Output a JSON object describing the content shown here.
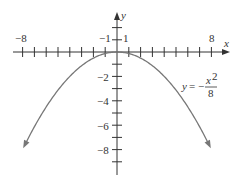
{
  "chart_data": {
    "type": "line",
    "title": "",
    "function": "y = -x^2/8",
    "equation_label": {
      "lhs": "y =",
      "sign": "−",
      "numerator": "x²",
      "denominator": "8"
    },
    "xlabel": "x",
    "ylabel": "y",
    "xlim": [
      -8,
      8
    ],
    "ylim": [
      -9,
      2
    ],
    "x_tick_labels": [
      {
        "value": -8,
        "label": "−8"
      },
      {
        "value": -1,
        "label": "−1"
      },
      {
        "value": 1,
        "label": "1"
      },
      {
        "value": 8,
        "label": "8"
      }
    ],
    "y_tick_labels": [
      {
        "value": -2,
        "label": "−2"
      },
      {
        "value": -4,
        "label": "−4"
      },
      {
        "value": -6,
        "label": "−6"
      },
      {
        "value": -8,
        "label": "−8"
      }
    ],
    "x_ticks": [
      -8,
      -7,
      -6,
      -5,
      -4,
      -3,
      -2,
      -1,
      1,
      2,
      3,
      4,
      5,
      6,
      7,
      8
    ],
    "y_ticks": [
      2,
      1,
      -1,
      -2,
      -3,
      -4,
      -5,
      -6,
      -7,
      -8,
      -9
    ],
    "series": [
      {
        "name": "y = -x^2/8",
        "x": [
          -8,
          -6,
          -4,
          -2,
          0,
          2,
          4,
          6,
          8
        ],
        "y": [
          -8,
          -4.5,
          -2,
          -0.5,
          0,
          -0.5,
          -2,
          -4.5,
          -8
        ]
      }
    ],
    "grid": false,
    "legend": "none",
    "curve_color": "#777777",
    "axis_color": "#333333"
  }
}
